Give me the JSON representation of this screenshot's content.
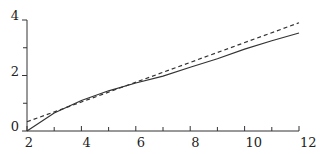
{
  "chart_data": {
    "type": "line",
    "title": "",
    "xlabel": "",
    "ylabel": "",
    "xlim": [
      2,
      12
    ],
    "ylim": [
      0,
      4
    ],
    "x_ticks_major": [
      2,
      4,
      6,
      8,
      10,
      12
    ],
    "x_ticks_minor": [
      3,
      5,
      7,
      9,
      11
    ],
    "x_tick_labels": [
      "2",
      "4",
      "6",
      "8",
      "10",
      "12"
    ],
    "y_ticks_major": [
      0,
      2,
      4
    ],
    "y_ticks_minor": [
      1,
      3
    ],
    "y_tick_labels": [
      "0",
      "2",
      "4"
    ],
    "grid": false,
    "legend": "none",
    "series": [
      {
        "name": "solid",
        "style": "solid",
        "x": [
          2,
          3,
          4,
          5,
          6,
          7,
          8,
          9,
          10,
          11,
          12
        ],
        "y": [
          0,
          0.65,
          1.1,
          1.45,
          1.73,
          1.98,
          2.3,
          2.6,
          2.95,
          3.25,
          3.53
        ]
      },
      {
        "name": "dashed",
        "style": "dashed",
        "x": [
          2,
          12
        ],
        "y": [
          0.33,
          3.9
        ]
      }
    ]
  }
}
